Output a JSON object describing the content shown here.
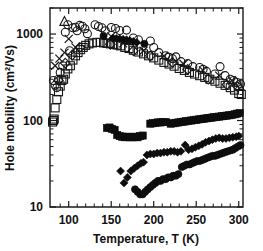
{
  "chart_data": {
    "type": "scatter",
    "title": "",
    "xlabel": "Temperature, T (K)",
    "ylabel": "Hole mobility (cm2/Vs)",
    "ylabel_display": "Hole mobility (cm²/Vs)",
    "xscale": "linear",
    "yscale": "log",
    "xlim": [
      78,
      305
    ],
    "ylim": [
      10,
      2000
    ],
    "grid": false,
    "legend": "none",
    "xticks": [
      100,
      150,
      200,
      250,
      300
    ],
    "xtick_labels": [
      "100",
      "150",
      "200",
      "250",
      "300"
    ],
    "xminor_ticks": [
      90,
      110,
      120,
      130,
      140,
      160,
      170,
      180,
      190,
      210,
      220,
      230,
      240,
      260,
      270,
      280,
      290
    ],
    "yticks": [
      10,
      100,
      1000
    ],
    "ytick_labels": [
      "10",
      "100",
      "1000"
    ],
    "yminor_ticks": [
      20,
      30,
      40,
      50,
      60,
      70,
      80,
      90,
      200,
      300,
      400,
      500,
      600,
      700,
      800,
      900,
      2000
    ],
    "series": [
      {
        "name": "open-circle-series",
        "marker": "open-circle",
        "points": [
          [
            82,
            290
          ],
          [
            84,
            255
          ],
          [
            86,
            240
          ],
          [
            88,
            300
          ],
          [
            90,
            360
          ],
          [
            93,
            430
          ],
          [
            96,
            1050
          ],
          [
            99,
            1280
          ],
          [
            101,
            640
          ],
          [
            105,
            1180
          ],
          [
            108,
            1200
          ],
          [
            110,
            1090
          ],
          [
            113,
            1260
          ],
          [
            116,
            1230
          ],
          [
            119,
            1150
          ],
          [
            122,
            1010
          ],
          [
            131,
            1280
          ],
          [
            135,
            1220
          ],
          [
            139,
            1180
          ],
          [
            143,
            1090
          ],
          [
            150,
            1190
          ],
          [
            155,
            1160
          ],
          [
            160,
            1100
          ],
          [
            168,
            1110
          ],
          [
            176,
            900
          ],
          [
            182,
            860
          ],
          [
            196,
            830
          ],
          [
            200,
            700
          ],
          [
            206,
            610
          ],
          [
            214,
            560
          ],
          [
            218,
            540
          ],
          [
            222,
            520
          ],
          [
            226,
            545
          ],
          [
            232,
            480
          ],
          [
            240,
            455
          ],
          [
            246,
            420
          ],
          [
            254,
            410
          ],
          [
            258,
            390
          ],
          [
            262,
            370
          ],
          [
            272,
            345
          ],
          [
            278,
            420
          ],
          [
            284,
            330
          ],
          [
            290,
            300
          ],
          [
            294,
            290
          ],
          [
            298,
            275
          ],
          [
            302,
            265
          ]
        ]
      },
      {
        "name": "open-square-series",
        "marker": "open-square",
        "points": [
          [
            81,
            96
          ],
          [
            82,
            100
          ],
          [
            83,
            104
          ],
          [
            84,
            140
          ],
          [
            86,
            175
          ],
          [
            88,
            215
          ],
          [
            90,
            250
          ],
          [
            92,
            290
          ],
          [
            94,
            300
          ],
          [
            96,
            345
          ],
          [
            99,
            395
          ],
          [
            102,
            430
          ],
          [
            105,
            500
          ],
          [
            108,
            560
          ],
          [
            111,
            610
          ],
          [
            114,
            660
          ],
          [
            117,
            700
          ],
          [
            120,
            740
          ],
          [
            124,
            770
          ],
          [
            128,
            790
          ],
          [
            133,
            800
          ],
          [
            137,
            800
          ],
          [
            141,
            790
          ],
          [
            145,
            780
          ],
          [
            149,
            770
          ],
          [
            153,
            760
          ],
          [
            157,
            745
          ],
          [
            161,
            730
          ],
          [
            166,
            700
          ],
          [
            171,
            680
          ],
          [
            176,
            650
          ],
          [
            182,
            620
          ],
          [
            188,
            590
          ],
          [
            194,
            560
          ],
          [
            200,
            530
          ],
          [
            206,
            500
          ],
          [
            212,
            470
          ],
          [
            218,
            450
          ],
          [
            224,
            425
          ],
          [
            230,
            400
          ],
          [
            236,
            380
          ],
          [
            242,
            360
          ],
          [
            248,
            345
          ],
          [
            254,
            330
          ],
          [
            260,
            315
          ],
          [
            266,
            300
          ],
          [
            272,
            285
          ],
          [
            278,
            270
          ],
          [
            284,
            255
          ],
          [
            290,
            240
          ],
          [
            295,
            225
          ],
          [
            300,
            205
          ],
          [
            303,
            200
          ]
        ]
      },
      {
        "name": "open-diamond-series",
        "marker": "open-diamond",
        "points": [
          [
            88,
            290
          ],
          [
            96,
            460
          ],
          [
            104,
            570
          ],
          [
            113,
            700
          ],
          [
            149,
            760
          ],
          [
            176,
            640
          ],
          [
            196,
            560
          ],
          [
            222,
            470
          ],
          [
            240,
            390
          ],
          [
            264,
            300
          ],
          [
            286,
            260
          ],
          [
            298,
            250
          ]
        ]
      },
      {
        "name": "cross-x-series",
        "marker": "x-cross",
        "points": [
          [
            84,
            430
          ],
          [
            89,
            520
          ],
          [
            95,
            610
          ],
          [
            100,
            880
          ],
          [
            108,
            700
          ],
          [
            150,
            940
          ],
          [
            164,
            780
          ],
          [
            188,
            640
          ],
          [
            212,
            560
          ],
          [
            235,
            450
          ],
          [
            258,
            380
          ],
          [
            277,
            330
          ],
          [
            292,
            290
          ]
        ]
      },
      {
        "name": "open-triangle-series",
        "marker": "open-triangle",
        "points": [
          [
            95,
            1400
          ],
          [
            301,
            250
          ]
        ]
      },
      {
        "name": "filled-diamond-upper-series",
        "marker": "filled-diamond",
        "points": [
          [
            152,
            900
          ],
          [
            156,
            890
          ],
          [
            160,
            880
          ],
          [
            164,
            870
          ],
          [
            168,
            860
          ],
          [
            172,
            840
          ],
          [
            176,
            820
          ],
          [
            180,
            800
          ]
        ]
      },
      {
        "name": "filled-circle-upper-series",
        "marker": "filled-circle",
        "points": [
          [
            141,
            950
          ],
          [
            189,
            770
          ]
        ]
      },
      {
        "name": "filled-square-series",
        "marker": "filled-square",
        "points": [
          [
            145,
            82
          ],
          [
            148,
            83
          ],
          [
            151,
            80
          ],
          [
            154,
            78
          ],
          [
            157,
            68
          ],
          [
            160,
            66
          ],
          [
            163,
            65
          ],
          [
            166,
            64
          ],
          [
            169,
            65
          ],
          [
            172,
            64
          ],
          [
            175,
            64
          ],
          [
            178,
            65
          ],
          [
            181,
            64
          ],
          [
            184,
            66
          ],
          [
            187,
            67
          ],
          [
            196,
            92
          ],
          [
            199,
            93
          ],
          [
            202,
            94
          ],
          [
            205,
            95
          ],
          [
            208,
            95
          ],
          [
            211,
            96
          ],
          [
            214,
            96
          ],
          [
            220,
            92
          ],
          [
            223,
            93
          ],
          [
            226,
            94
          ],
          [
            229,
            95
          ],
          [
            232,
            96
          ],
          [
            235,
            97
          ],
          [
            238,
            98
          ],
          [
            241,
            99
          ],
          [
            244,
            100
          ],
          [
            247,
            101
          ],
          [
            250,
            102
          ],
          [
            253,
            103
          ],
          [
            256,
            104
          ],
          [
            259,
            105
          ],
          [
            262,
            106
          ],
          [
            265,
            107
          ],
          [
            268,
            108
          ],
          [
            271,
            109
          ],
          [
            274,
            110
          ],
          [
            277,
            111
          ],
          [
            280,
            112
          ],
          [
            283,
            113
          ],
          [
            286,
            114
          ],
          [
            289,
            115
          ],
          [
            292,
            116
          ],
          [
            295,
            118
          ],
          [
            298,
            120
          ],
          [
            301,
            122
          ]
        ]
      },
      {
        "name": "filled-diamond-lower-series",
        "marker": "filled-diamond",
        "points": [
          [
            161,
            26
          ],
          [
            165,
            19
          ],
          [
            169,
            22
          ],
          [
            173,
            26
          ],
          [
            177,
            28
          ],
          [
            181,
            30
          ],
          [
            185,
            32
          ],
          [
            188,
            33
          ],
          [
            192,
            40
          ],
          [
            196,
            41
          ],
          [
            200,
            41
          ],
          [
            204,
            42
          ],
          [
            208,
            42
          ],
          [
            212,
            43
          ],
          [
            216,
            43
          ],
          [
            220,
            44
          ],
          [
            224,
            44
          ],
          [
            228,
            43
          ],
          [
            232,
            44
          ],
          [
            237,
            52
          ],
          [
            241,
            46
          ],
          [
            245,
            47
          ],
          [
            249,
            49
          ],
          [
            253,
            51
          ],
          [
            257,
            53
          ],
          [
            261,
            56
          ],
          [
            265,
            58
          ],
          [
            269,
            60
          ],
          [
            273,
            62
          ],
          [
            277,
            63
          ],
          [
            281,
            62
          ],
          [
            285,
            62
          ],
          [
            289,
            63
          ],
          [
            293,
            64
          ],
          [
            297,
            65
          ],
          [
            300,
            66
          ]
        ]
      },
      {
        "name": "filled-circle-lower-series",
        "marker": "filled-circle",
        "points": [
          [
            178,
            16
          ],
          [
            181,
            15
          ],
          [
            184,
            14
          ],
          [
            187,
            14
          ],
          [
            190,
            15
          ],
          [
            193,
            16
          ],
          [
            196,
            17
          ],
          [
            199,
            18
          ],
          [
            202,
            19
          ],
          [
            205,
            20
          ],
          [
            208,
            20
          ],
          [
            211,
            21
          ],
          [
            214,
            21
          ],
          [
            217,
            22
          ],
          [
            220,
            22
          ],
          [
            223,
            23
          ],
          [
            226,
            23
          ],
          [
            229,
            24
          ],
          [
            233,
            29
          ],
          [
            236,
            30
          ],
          [
            239,
            31
          ],
          [
            242,
            31
          ],
          [
            245,
            32
          ],
          [
            248,
            33
          ],
          [
            251,
            34
          ],
          [
            254,
            34
          ],
          [
            257,
            35
          ],
          [
            260,
            36
          ],
          [
            263,
            37
          ],
          [
            266,
            38
          ],
          [
            269,
            39
          ],
          [
            272,
            39
          ],
          [
            275,
            40
          ],
          [
            278,
            41
          ],
          [
            281,
            42
          ],
          [
            284,
            43
          ],
          [
            287,
            44
          ],
          [
            290,
            45
          ],
          [
            293,
            46
          ],
          [
            296,
            48
          ],
          [
            299,
            50
          ],
          [
            302,
            52
          ]
        ]
      }
    ]
  }
}
